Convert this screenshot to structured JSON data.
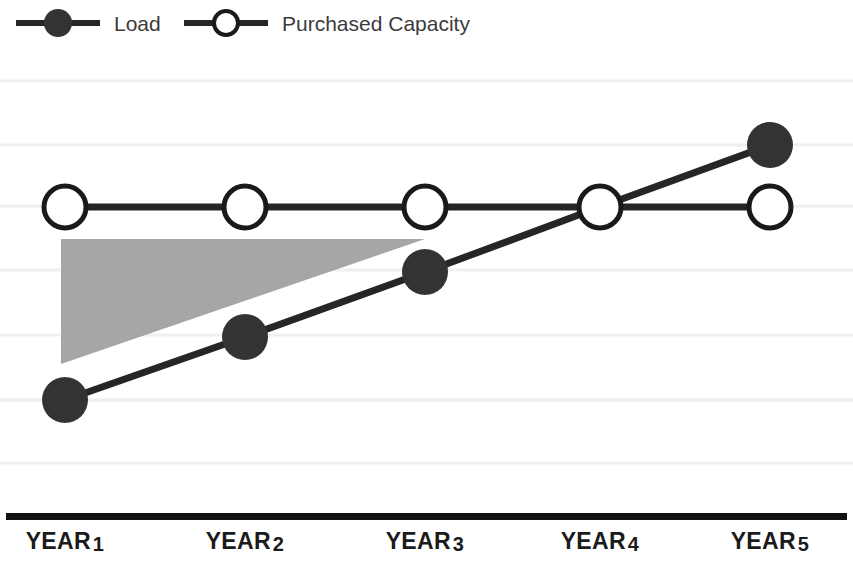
{
  "legend": {
    "position": "top-left",
    "entries": [
      {
        "label": "Load",
        "marker": "filled-circle-with-line",
        "color": "#333333"
      },
      {
        "label": "Purchased Capacity",
        "marker": "hollow-circle-with-line",
        "color": "#1a1a1a"
      }
    ]
  },
  "axis": {
    "x_labels": [
      {
        "text": "YEAR",
        "num": "1"
      },
      {
        "text": "YEAR",
        "num": "2"
      },
      {
        "text": "YEAR",
        "num": "3"
      },
      {
        "text": "YEAR",
        "num": "4"
      },
      {
        "text": "YEAR",
        "num": "5"
      }
    ]
  },
  "chart_data": {
    "type": "line",
    "title": "",
    "subtitle": "",
    "xlabel": "",
    "ylabel": "",
    "categories": [
      "YEAR 1",
      "YEAR 2",
      "YEAR 3",
      "YEAR 4",
      "YEAR 5"
    ],
    "series": [
      {
        "name": "Load",
        "values": [
          1.0,
          2.0,
          3.0,
          4.0,
          5.5
        ],
        "marker": "filled-circle",
        "color": "#333333",
        "note": "rises steadily, crossing Purchased Capacity at Year 4 and exceeding it at Year 5"
      },
      {
        "name": "Purchased Capacity",
        "values": [
          4.0,
          4.0,
          4.0,
          4.0,
          4.0
        ],
        "marker": "hollow-circle",
        "color": "#1a1a1a",
        "note": "flat across all five years"
      }
    ],
    "ylim": [
      0,
      7
    ],
    "yticks": [
      0,
      1,
      2,
      3,
      4,
      5,
      6
    ],
    "ytick_labels": [],
    "grid": true,
    "grid_axis": "y",
    "grid_color": "#f0f0f0",
    "legend_position": "top-left",
    "annotations": [
      {
        "type": "shaded-region",
        "name": "excess-capacity-region",
        "color": "#a6a6a6",
        "opacity": 1,
        "description": "Gray wedge between the Purchased Capacity line and the Load line from Year 1 to Year 3, representing unused (stranded) purchased capacity."
      }
    ]
  },
  "geometry": {
    "plot": {
      "x": 0,
      "y": 46,
      "width": 853,
      "height": 470
    },
    "x_positions": [
      65,
      245,
      425,
      600,
      770
    ],
    "gridlines_y": [
      35,
      99,
      160,
      224,
      289,
      354,
      417
    ],
    "load_points_y": [
      354,
      291,
      226,
      161,
      99
    ],
    "capacity_y": 161,
    "wedge": {
      "left": 61,
      "top": 193,
      "right": 425,
      "bottom_left": 318
    },
    "marker_radius_filled": 23,
    "marker_radius_hollow": 21,
    "line_width": 7
  },
  "colors": {
    "background": "#ffffff",
    "line_dark": "#262626",
    "marker_fill": "#333333",
    "marker_stroke": "#1a1a1a",
    "wedge_gray": "#a6a6a6",
    "gridline": "#f0f0f0",
    "axis_black": "#111111",
    "text": "#1b1b1b"
  }
}
